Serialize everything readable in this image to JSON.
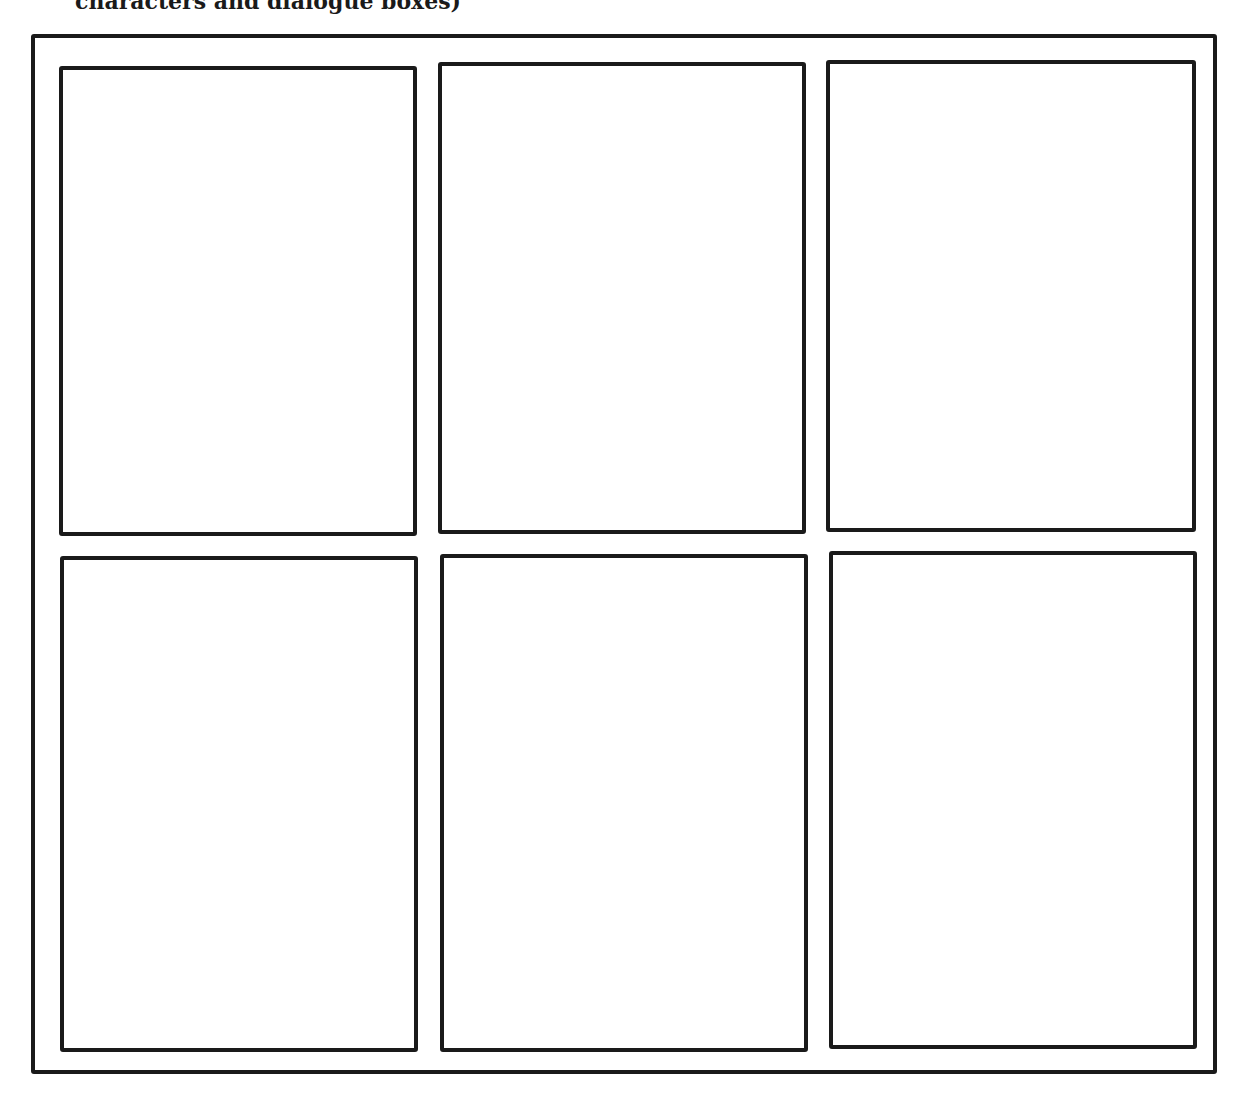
{
  "header": {
    "partial_text": "characters and dialogue boxes)"
  },
  "grid": {
    "rows": 2,
    "columns": 3,
    "panels": [
      {
        "id": 1,
        "row": 1,
        "col": 1
      },
      {
        "id": 2,
        "row": 1,
        "col": 2
      },
      {
        "id": 3,
        "row": 1,
        "col": 3
      },
      {
        "id": 4,
        "row": 2,
        "col": 1
      },
      {
        "id": 5,
        "row": 2,
        "col": 2
      },
      {
        "id": 6,
        "row": 2,
        "col": 3
      }
    ]
  }
}
